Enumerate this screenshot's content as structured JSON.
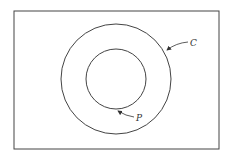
{
  "diagram": {
    "frame": {
      "x": 14,
      "y": 11,
      "width": 205,
      "height": 138
    },
    "outer_circle": {
      "label": "C",
      "cx": 116,
      "cy": 79,
      "r": 55
    },
    "inner_circle": {
      "label": "P",
      "cx": 116,
      "cy": 79,
      "r": 30
    },
    "stroke_color": "#333333"
  }
}
